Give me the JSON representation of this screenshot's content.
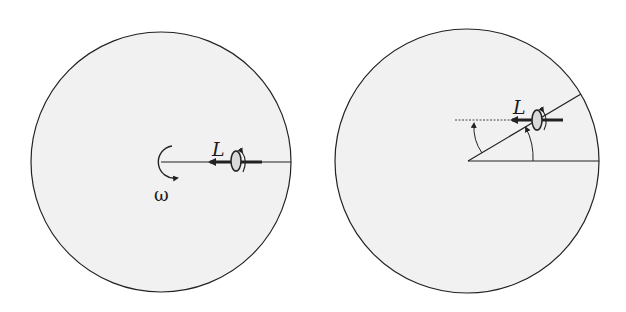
{
  "colors": {
    "background": "#ffffff",
    "disk_fill": "#f1f1f1",
    "stroke": "#222222",
    "gyro_fill": "#d9d9d9"
  },
  "panels": [
    {
      "id": "left",
      "circle": {
        "cx": 161,
        "cy": 162,
        "r": 130
      },
      "labels": {
        "angular_momentum": "L",
        "angular_velocity": "ω"
      }
    },
    {
      "id": "right",
      "circle": {
        "cx": 467,
        "cy": 161,
        "r": 132
      },
      "labels": {
        "angular_momentum": "L"
      }
    }
  ]
}
